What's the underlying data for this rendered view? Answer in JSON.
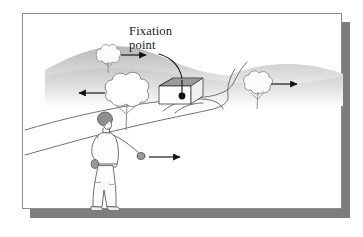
{
  "figure": {
    "type": "illustration",
    "topic": "motion-parallax-during-observer-locomotion",
    "background_color": "#ffffff",
    "frame": {
      "border_color": "#8d8d8d",
      "shadow_color": "#7d7d7d",
      "fill_color": "#ffffff"
    }
  },
  "annotations": {
    "fixation_label_line1": "Fixation",
    "fixation_label_line2": "point",
    "leader_line": "curved-pointer-to-house"
  },
  "scene": {
    "sky_color": "#ffffff",
    "hills": [
      {
        "name": "left-hill",
        "fill_top": "#bfbfbf",
        "fill_bottom": "#f2f2f2"
      },
      {
        "name": "right-hill",
        "fill_top": "#cccccc",
        "fill_bottom": "#f5f5f5"
      }
    ],
    "house": {
      "name": "house-with-fixation-point",
      "roof_color": "#9a9a9a",
      "wall_color": "#ffffff",
      "outline_color": "#444444",
      "fixation_dot_color": "#111111"
    },
    "path": {
      "name": "winding-road",
      "stroke_color": "#555555"
    },
    "walker": {
      "name": "walking-observer",
      "hair_color": "#777777",
      "outline_color": "#555555",
      "direction": "right"
    },
    "trees": [
      {
        "name": "far-tree-top-left",
        "x": 97,
        "y": 44,
        "scale": 0.55,
        "arrow": "right"
      },
      {
        "name": "near-tree-left",
        "x": 112,
        "y": 85,
        "scale": 1.0,
        "arrow": "left"
      },
      {
        "name": "far-tree-right",
        "x": 235,
        "y": 73,
        "scale": 0.7,
        "arrow": "right"
      }
    ],
    "arrows": [
      {
        "name": "arrow-far-tree-top-left",
        "direction": "right",
        "x1": 102,
        "y1": 48,
        "x2": 125,
        "y2": 48
      },
      {
        "name": "arrow-near-tree-left",
        "direction": "left",
        "x1": 110,
        "y1": 86,
        "x2": 84,
        "y2": 86
      },
      {
        "name": "arrow-far-tree-right",
        "direction": "right",
        "x1": 240,
        "y1": 75,
        "x2": 266,
        "y2": 75
      },
      {
        "name": "arrow-observer-heading",
        "direction": "right",
        "x1": 126,
        "y1": 145,
        "x2": 155,
        "y2": 145
      }
    ]
  }
}
